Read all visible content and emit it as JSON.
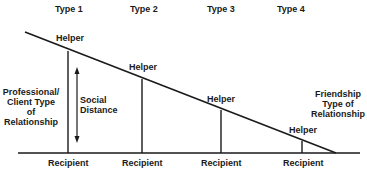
{
  "diagram": {
    "types": [
      "Type 1",
      "Type 2",
      "Type 3",
      "Type 4"
    ],
    "helper_label": "Helper",
    "recipient_label": "Recipient",
    "left_label": [
      "Professional/",
      "Client Type",
      "of",
      "Relationship"
    ],
    "right_label": [
      "Friendship",
      "Type of",
      "Relationship"
    ],
    "axis_label": [
      "Social",
      "Distance"
    ],
    "colors": {
      "ink": "#1a1a1a",
      "background": "#ffffff"
    }
  }
}
